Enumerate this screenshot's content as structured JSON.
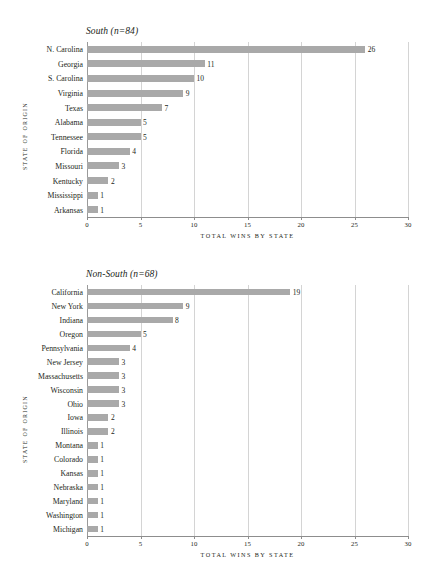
{
  "chart_data": [
    {
      "type": "bar",
      "orientation": "horizontal",
      "title": "South (n=84)",
      "xlabel": "TOTAL WINS BY STATE",
      "ylabel": "STATE OF ORIGIN",
      "xlim": [
        0,
        30
      ],
      "xticks": [
        0,
        5,
        10,
        15,
        20,
        25,
        30
      ],
      "grid": true,
      "legend": "none",
      "categories": [
        "N. Carolina",
        "Georgia",
        "S. Carolina",
        "Virginia",
        "Texas",
        "Alabama",
        "Tennessee",
        "Florida",
        "Missouri",
        "Kentucky",
        "Mississippi",
        "Arkansas"
      ],
      "values": [
        26,
        11,
        10,
        9,
        7,
        5,
        5,
        4,
        3,
        2,
        1,
        1
      ],
      "bar_color": "#a9a9a9"
    },
    {
      "type": "bar",
      "orientation": "horizontal",
      "title": "Non-South (n=68)",
      "xlabel": "TOTAL WINS BY STATE",
      "ylabel": "STATE OF ORIGIN",
      "xlim": [
        0,
        30
      ],
      "xticks": [
        0,
        5,
        10,
        15,
        20,
        25,
        30
      ],
      "grid": true,
      "legend": "none",
      "categories": [
        "California",
        "New York",
        "Indiana",
        "Oregon",
        "Pennsylvania",
        "New Jersey",
        "Massachusetts",
        "Wisconsin",
        "Ohio",
        "Iowa",
        "Illinois",
        "Montana",
        "Colorado",
        "Kansas",
        "Nebraska",
        "Maryland",
        "Washington",
        "Michigan"
      ],
      "values": [
        19,
        9,
        8,
        5,
        4,
        3,
        3,
        3,
        3,
        2,
        2,
        1,
        1,
        1,
        1,
        1,
        1,
        1
      ],
      "bar_color": "#a9a9a9"
    }
  ]
}
